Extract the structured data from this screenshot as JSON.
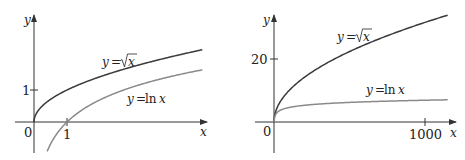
{
  "chart_data": [
    {
      "type": "line",
      "title": "",
      "xlabel": "x",
      "ylabel": "y",
      "x_ticks": [
        "1"
      ],
      "y_ticks": [
        "1"
      ],
      "origin_label": "0",
      "xlim": [
        -0.9,
        5.3
      ],
      "ylim": [
        -1.0,
        3.3
      ],
      "grid": false,
      "series": [
        {
          "name": "y = √x",
          "function": "sqrt(x)",
          "color": "#3a3a3a",
          "x": [
            0,
            0.25,
            0.5,
            1,
            2,
            3,
            4,
            5.1
          ],
          "values": [
            0,
            0.5,
            0.71,
            1,
            1.41,
            1.73,
            2,
            2.26
          ]
        },
        {
          "name": "y = ln x",
          "function": "ln(x)",
          "color": "#8a8a8a",
          "x": [
            0.4,
            0.5,
            1,
            2,
            3,
            4,
            5.1
          ],
          "values": [
            -0.92,
            -0.69,
            0,
            0.69,
            1.1,
            1.39,
            1.63
          ]
        }
      ],
      "annotations": [
        "y = √x",
        "y = ln x"
      ]
    },
    {
      "type": "line",
      "title": "",
      "xlabel": "x",
      "ylabel": "y",
      "x_ticks": [
        "1000"
      ],
      "y_ticks": [
        "20"
      ],
      "origin_label": "0",
      "xlim": [
        -50,
        1200
      ],
      "ylim": [
        -10,
        37
      ],
      "grid": false,
      "series": [
        {
          "name": "y = √x",
          "function": "sqrt(x)",
          "color": "#3a3a3a",
          "x": [
            0,
            10,
            50,
            100,
            250,
            500,
            750,
            1000,
            1150
          ],
          "values": [
            0,
            3.16,
            7.07,
            10,
            15.8,
            22.4,
            27.4,
            31.6,
            33.9
          ]
        },
        {
          "name": "y = ln x",
          "function": "ln(x)",
          "color": "#8a8a8a",
          "x": [
            1,
            10,
            50,
            100,
            250,
            500,
            750,
            1000,
            1150
          ],
          "values": [
            0,
            2.3,
            3.91,
            4.61,
            5.52,
            6.21,
            6.62,
            6.91,
            7.05
          ]
        }
      ],
      "annotations": [
        "y = √x",
        "y = ln x"
      ]
    }
  ],
  "panels": {
    "left": {
      "y_axis_label": "y",
      "x_axis_label": "x",
      "origin_label": "0",
      "y_tick_label": "1",
      "x_tick_label": "1",
      "sqrt_label": {
        "prefix": "y",
        "eq": "=",
        "radicand": "x"
      },
      "ln_label": {
        "prefix": "y",
        "eq": "=",
        "fn": "ln",
        "arg": "x"
      }
    },
    "right": {
      "y_axis_label": "y",
      "x_axis_label": "x",
      "origin_label": "0",
      "y_tick_label": "20",
      "x_tick_label": "1000",
      "sqrt_label": {
        "prefix": "y",
        "eq": "=",
        "radicand": "x"
      },
      "ln_label": {
        "prefix": "y",
        "eq": "=",
        "fn": "ln",
        "arg": "x"
      }
    }
  },
  "colors": {
    "axis": "#333333",
    "sqrt_curve": "#3a3a3a",
    "ln_curve": "#8a8a8a"
  }
}
